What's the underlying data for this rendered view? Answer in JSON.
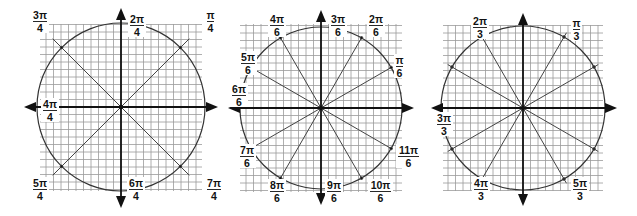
{
  "colors": {
    "background": "#ffffff",
    "grid": "#9a9a9a",
    "axis": "#111111",
    "circle": "#333333",
    "ray": "#444444",
    "label": "#111111"
  },
  "panels": [
    {
      "name": "unit-circle-quarter-pi",
      "center": [
        121,
        107
      ],
      "grid": {
        "x0": 40,
        "y0": 24,
        "x1": 202,
        "y1": 191,
        "cell": 7.5
      },
      "radius": 84,
      "axis": {
        "left": 24,
        "right": 218,
        "top": 8,
        "bottom": 208
      },
      "ray_extend": 1.15,
      "rays_deg": [
        45,
        135
      ],
      "labels": [
        {
          "num": "3π",
          "den": "4",
          "x": 33,
          "y": 10
        },
        {
          "num": "2π",
          "den": "4",
          "x": 130,
          "y": 14
        },
        {
          "num": "π",
          "den": "4",
          "x": 207,
          "y": 10
        },
        {
          "num": "4π",
          "den": "4",
          "x": 43,
          "y": 99
        },
        {
          "num": "5π",
          "den": "4",
          "x": 33,
          "y": 178
        },
        {
          "num": "6π",
          "den": "4",
          "x": 129,
          "y": 178
        },
        {
          "num": "7π",
          "den": "4",
          "x": 207,
          "y": 178
        }
      ]
    },
    {
      "name": "unit-circle-sixth-pi",
      "center": [
        321,
        108
      ],
      "grid": {
        "x0": 240,
        "y0": 24,
        "x1": 402,
        "y1": 192,
        "cell": 7.5
      },
      "radius": 81,
      "axis": {
        "left": 228,
        "right": 414,
        "top": 10,
        "bottom": 205
      },
      "ray_extend": 1.0,
      "rays_deg": [
        30,
        60,
        120,
        150
      ],
      "labels": [
        {
          "num": "4π",
          "den": "6",
          "x": 270,
          "y": 14
        },
        {
          "num": "3π",
          "den": "6",
          "x": 331,
          "y": 14
        },
        {
          "num": "2π",
          "den": "6",
          "x": 369,
          "y": 14
        },
        {
          "num": "5π",
          "den": "6",
          "x": 241,
          "y": 52
        },
        {
          "num": "π",
          "den": "6",
          "x": 396,
          "y": 55
        },
        {
          "num": "6π",
          "den": "6",
          "x": 232,
          "y": 84
        },
        {
          "num": "7π",
          "den": "6",
          "x": 240,
          "y": 145
        },
        {
          "num": "11π",
          "den": "6",
          "x": 398,
          "y": 145
        },
        {
          "num": "8π",
          "den": "6",
          "x": 270,
          "y": 180
        },
        {
          "num": "9π",
          "den": "6",
          "x": 327,
          "y": 180
        },
        {
          "num": "10π",
          "den": "6",
          "x": 370,
          "y": 180
        }
      ]
    },
    {
      "name": "unit-circle-third-pi",
      "center": [
        523,
        108
      ],
      "grid": {
        "x0": 443,
        "y0": 25,
        "x1": 603,
        "y1": 191,
        "cell": 7.5
      },
      "radius": 82,
      "axis": {
        "left": 431,
        "right": 617,
        "top": 13,
        "bottom": 206
      },
      "ray_extend": 1.06,
      "rays_deg": [
        30,
        60,
        120,
        150
      ],
      "labels": [
        {
          "num": "2π",
          "den": "3",
          "x": 473,
          "y": 16
        },
        {
          "num": "π",
          "den": "3",
          "x": 573,
          "y": 18
        },
        {
          "num": "3π",
          "den": "3",
          "x": 437,
          "y": 113
        },
        {
          "num": "4π",
          "den": "3",
          "x": 474,
          "y": 178
        },
        {
          "num": "5π",
          "den": "3",
          "x": 573,
          "y": 178
        }
      ]
    }
  ]
}
